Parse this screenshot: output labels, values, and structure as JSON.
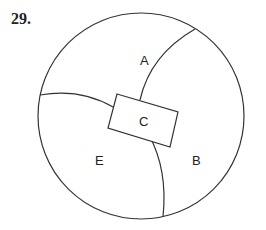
{
  "problem_number": "29.",
  "diagram": {
    "shape": "circle",
    "regions": [
      {
        "id": "A",
        "label": "A"
      },
      {
        "id": "B",
        "label": "B"
      },
      {
        "id": "C",
        "label": "C"
      },
      {
        "id": "E",
        "label": "E"
      }
    ],
    "stroke_color": "#333333"
  }
}
